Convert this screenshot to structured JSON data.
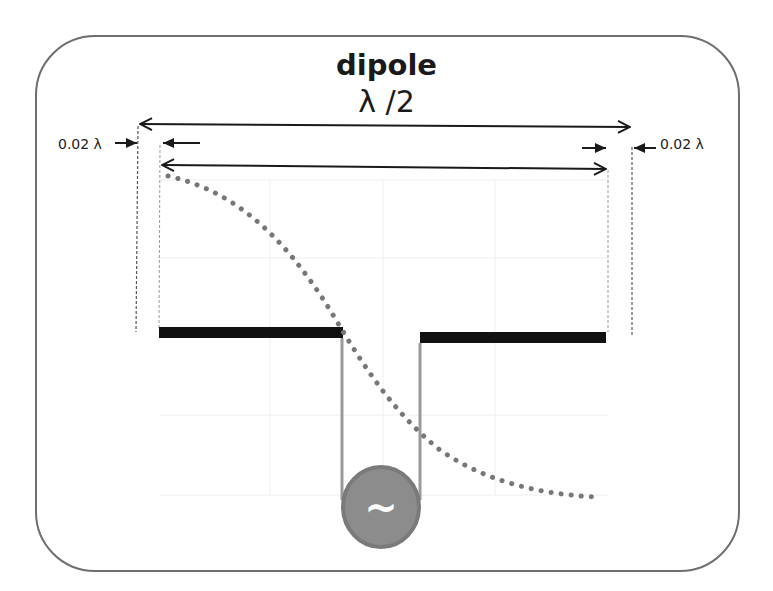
{
  "diagram": {
    "title": "dipole",
    "length_label": "λ /2",
    "gap_label_left": "0.02 λ",
    "gap_label_right": "0.02 λ",
    "source_symbol": "~",
    "elements": {
      "outer_dimension": "λ /2 total length arrow",
      "inner_dimension": "physical dipole length arrow",
      "left_arm": "left dipole element",
      "right_arm": "right dipole element",
      "feed_lines": "transmission line to source",
      "source": "AC source",
      "current_distribution": "dotted current/voltage curve"
    },
    "colors": {
      "frame": "#6e6e6e",
      "arms": "#111111",
      "feed": "#9a9a9a",
      "source_fill": "#8c8c8c",
      "source_stroke": "#7a7a7a",
      "curve": "#777777",
      "dimension": "#1a1a1a",
      "dashed_guides": "#555555"
    }
  }
}
